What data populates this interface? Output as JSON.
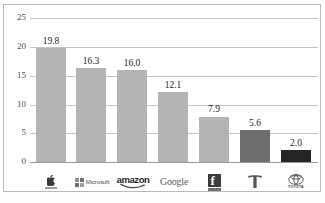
{
  "chart_data": {
    "type": "bar",
    "title": "",
    "subtitle": "",
    "xlabel": "",
    "ylabel": "",
    "categories": [
      "Apple",
      "Microsoft",
      "amazon",
      "Google",
      "Facebook",
      "Tesla",
      "TOYOTA"
    ],
    "values": [
      19.8,
      16.3,
      16.0,
      12.1,
      7.9,
      5.6,
      2.0
    ],
    "value_labels": [
      "19.8",
      "16.3",
      "16.0",
      "12.1",
      "7.9",
      "5.6",
      "2.0"
    ],
    "ylim": [
      0,
      25
    ],
    "yticks": [
      0,
      5,
      10,
      15,
      20,
      25
    ],
    "ytick_labels": [
      "0",
      "5",
      "10",
      "15",
      "20",
      "25"
    ],
    "grid": true,
    "grid_axis": "y",
    "legend": "none",
    "bar_colors": [
      "#b3b3b3",
      "#b3b3b3",
      "#b3b3b3",
      "#b3b3b3",
      "#b3b3b3",
      "#6e6e6e",
      "#262626"
    ],
    "series": [
      {
        "name": "",
        "values": [
          19.8,
          16.3,
          16.0,
          12.1,
          7.9,
          5.6,
          2.0
        ]
      }
    ]
  },
  "axis": {
    "ytick_labels": [
      "25",
      "20",
      "15",
      "10",
      "5",
      "0"
    ]
  },
  "logos": [
    {
      "name": "apple-logo",
      "label": "",
      "icon": "apple-icon"
    },
    {
      "name": "microsoft-logo",
      "label": "Microsoft",
      "icon": "microsoft-squares-icon"
    },
    {
      "name": "amazon-logo",
      "label": "amazon",
      "icon": "amazon-smile-icon"
    },
    {
      "name": "google-logo",
      "label": "Google",
      "icon": "google-wordmark-icon"
    },
    {
      "name": "facebook-logo",
      "label": "f",
      "icon": "facebook-f-icon"
    },
    {
      "name": "tesla-logo",
      "label": "",
      "icon": "tesla-t-icon"
    },
    {
      "name": "toyota-logo",
      "label": "TOYOTA",
      "icon": "toyota-ellipses-icon"
    }
  ],
  "colors": {
    "bar_light": "#b3b3b3",
    "bar_mid": "#6e6e6e",
    "bar_dark": "#262626",
    "gridline": "#c4c4c4",
    "frame": "#b9b9b9",
    "text": "#1a1a1a"
  }
}
